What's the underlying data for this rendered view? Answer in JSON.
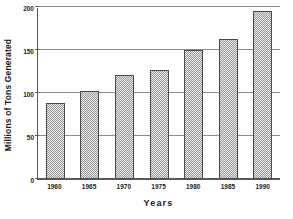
{
  "chart_data": {
    "type": "bar",
    "title": "",
    "xlabel": "Years",
    "ylabel": "Millions of Tons Generated",
    "categories": [
      "1960",
      "1965",
      "1970",
      "1975",
      "1980",
      "1985",
      "1990"
    ],
    "values": [
      88,
      102,
      121,
      127,
      150,
      163,
      195
    ],
    "ylim": [
      0,
      200
    ],
    "yticks": [
      0,
      50,
      100,
      150,
      200
    ],
    "ytick_labels": [
      "0",
      "50",
      "100",
      "150",
      "200"
    ],
    "grid": "horizontal",
    "legend": "none",
    "series": [
      {
        "name": "Millions of Tons Generated",
        "values": [
          88,
          102,
          121,
          127,
          150,
          163,
          195
        ]
      }
    ],
    "colors": {
      "bar_fill": "#9a9a9a",
      "bar_outline": "#4a4a4a",
      "gridline": "#8c8c8c",
      "axis": "#5a5a5a",
      "text": "#1a1a1a",
      "background": "#ffffff"
    }
  }
}
